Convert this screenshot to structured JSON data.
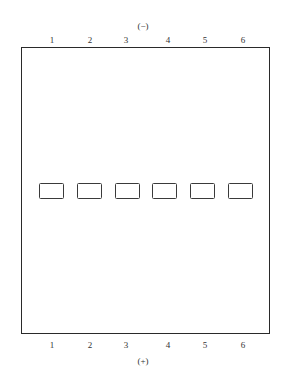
{
  "diagram": {
    "top_polarity": "(−)",
    "bottom_polarity": "(+)",
    "lanes_top": [
      "1",
      "2",
      "3",
      "4",
      "5",
      "6"
    ],
    "lanes_bottom": [
      "1",
      "2",
      "3",
      "4",
      "5",
      "6"
    ],
    "well_count": 6,
    "colors": {
      "line": "#2a2a2a",
      "background": "#ffffff"
    }
  }
}
